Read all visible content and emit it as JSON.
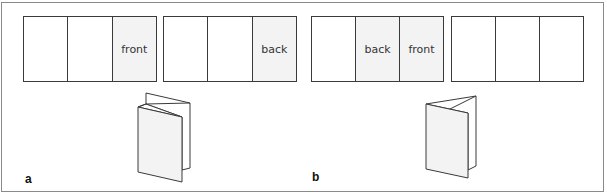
{
  "figure": {
    "panel_a": {
      "label": "a",
      "strips": [
        {
          "panels": [
            {
              "text": "",
              "shaded": false
            },
            {
              "text": "",
              "shaded": false
            },
            {
              "text": "front",
              "shaded": true
            }
          ]
        },
        {
          "panels": [
            {
              "text": "",
              "shaded": false
            },
            {
              "text": "",
              "shaded": false
            },
            {
              "text": "back",
              "shaded": true
            }
          ]
        }
      ],
      "illustration": "accordion-fold-leaflet"
    },
    "panel_b": {
      "label": "b",
      "strips": [
        {
          "panels": [
            {
              "text": "",
              "shaded": false
            },
            {
              "text": "back",
              "shaded": true
            },
            {
              "text": "front",
              "shaded": true
            }
          ]
        },
        {
          "panels": [
            {
              "text": "",
              "shaded": false
            },
            {
              "text": "",
              "shaded": false
            },
            {
              "text": "",
              "shaded": false
            }
          ]
        }
      ],
      "illustration": "roll-fold-leaflet"
    },
    "colors": {
      "stroke": "#3a3a3a",
      "shade": "#f3f3f3",
      "frame": "#8a8a8a"
    }
  }
}
